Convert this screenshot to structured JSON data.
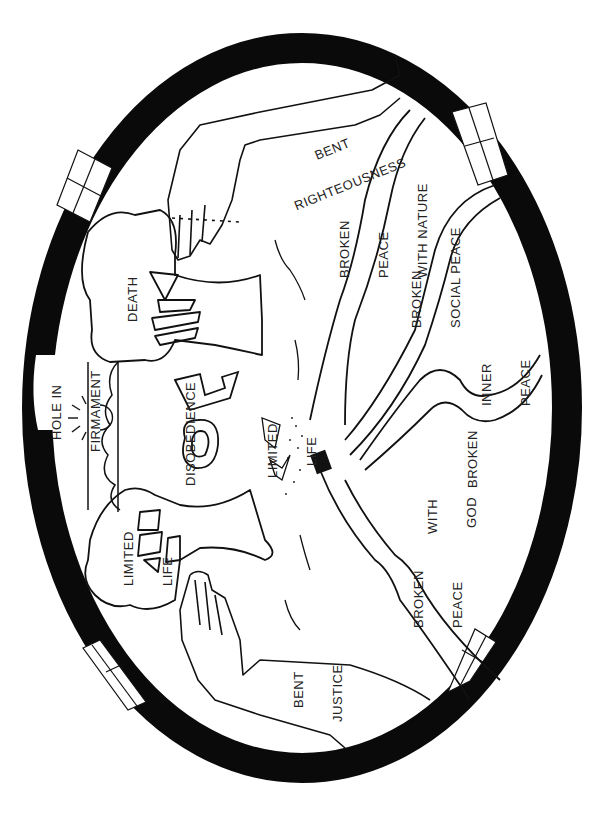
{
  "figure": {
    "type": "line-art illustration",
    "colors": {
      "ink": "#111111",
      "paper": "#ffffff",
      "ring": "#0a0a0a"
    }
  },
  "labels": {
    "bent_righteousness": [
      "BENT",
      "RIGHTEOUSNESS"
    ],
    "broken_peace_with_nature": [
      "BROKEN",
      "PEACE",
      "WITH NATURE"
    ],
    "broken_social_peace": [
      "BROKEN",
      "SOCIAL PEACE"
    ],
    "death": [
      "DEATH"
    ],
    "hole_in_firmament": [
      "HOLE IN",
      "FIRMAMENT"
    ],
    "disobedience": [
      "DISOBEDIENCE"
    ],
    "limited_life_center": [
      "LIMITED",
      "LIFE"
    ],
    "limited_life_tree": [
      "LIMITED",
      "LIFE"
    ],
    "inner_peace": [
      "INNER",
      "PEACE"
    ],
    "broken_inner": [
      "BROKEN"
    ],
    "with_god": [
      "WITH",
      "GOD"
    ],
    "broken_peace": [
      "BROKEN",
      "PEACE"
    ],
    "bent_justice": [
      "BENT",
      "JUSTICE"
    ]
  },
  "icons": {
    "ring": "firmament-oval-ring",
    "hand_top": "hand-icon",
    "hand_bottom": "hand-icon",
    "tree_top": "tree-death-icon",
    "tree_bottom": "tree-life-icon",
    "key": "key-icon",
    "book": "book-icon",
    "sun": "sun-icon",
    "figures": "human-figures-icon",
    "plants": "plant-sprig-icon"
  }
}
